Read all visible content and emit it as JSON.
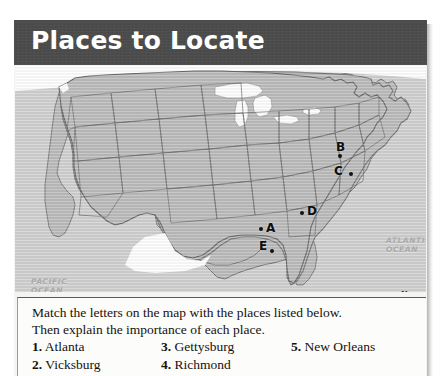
{
  "header": {
    "title": "Places to Locate",
    "bar_color": "#4a4a4a",
    "text_color": "#ffffff"
  },
  "map": {
    "land_color": "#b9b9b9",
    "water_color": "#ffffff",
    "border_color": "#6d6d6d",
    "background_color": "#cfcfcf",
    "oceans": [
      {
        "name": "pacific-ocean-label",
        "line1": "PACIFIC",
        "line2": "OCEAN"
      },
      {
        "name": "atlantic-ocean-label",
        "line1": "ATLANTIC",
        "line2": "OCEAN"
      }
    ],
    "points": [
      {
        "letter": "B",
        "x": 336,
        "y": 141,
        "dot_x": 338,
        "dot_y": 154
      },
      {
        "letter": "C",
        "x": 334,
        "y": 165,
        "dot_x": 349,
        "dot_y": 172
      },
      {
        "letter": "D",
        "x": 307,
        "y": 205,
        "dot_x": 300,
        "dot_y": 212
      },
      {
        "letter": "A",
        "x": 266,
        "y": 222,
        "dot_x": 259,
        "dot_y": 227
      },
      {
        "letter": "E",
        "x": 259,
        "y": 240,
        "dot_x": 270,
        "dot_y": 250
      }
    ],
    "compass": {
      "north": "N",
      "south": "S",
      "east": "E",
      "west": "W"
    }
  },
  "instructions": {
    "line1": "Match the letters on the map with the places listed below.",
    "line2": "Then explain the importance of each place."
  },
  "places": [
    {
      "num": "1.",
      "name": "Atlanta"
    },
    {
      "num": "2.",
      "name": "Vicksburg"
    },
    {
      "num": "3.",
      "name": "Gettysburg"
    },
    {
      "num": "4.",
      "name": "Richmond"
    },
    {
      "num": "5.",
      "name": "New Orleans"
    }
  ]
}
